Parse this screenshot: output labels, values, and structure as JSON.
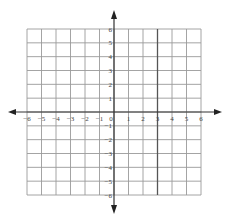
{
  "diagram": {
    "type": "coordinate-plane",
    "x_range": [
      -6,
      6
    ],
    "y_range": [
      -6,
      6
    ],
    "x_tick_labels": [
      "−6",
      "−5",
      "−4",
      "−3",
      "−2",
      "−1",
      "0",
      "1",
      "2",
      "3",
      "4",
      "5",
      "6"
    ],
    "y_tick_labels_positive": [
      "1",
      "2",
      "3",
      "4",
      "5",
      "6"
    ],
    "y_tick_labels_negative": [
      "−1",
      "−2",
      "−3",
      "−4",
      "−5",
      "−6"
    ],
    "highlighted_line": {
      "equation": "x = 3",
      "x": 3
    },
    "colors": {
      "grid": "#9a9a9a",
      "axis": "#333333",
      "highlight": "#555555",
      "label": "#444444",
      "background": "#ffffff"
    }
  }
}
